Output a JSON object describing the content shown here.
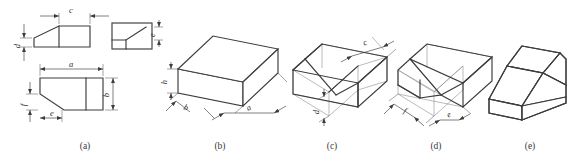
{
  "figure": {
    "line_color": "#3c3c3c",
    "thin_line_color": "#6e6e6e",
    "label_color": "#3a3a3a",
    "background": "#ffffff"
  },
  "captions": [
    {
      "key": "a",
      "label": "(a)"
    },
    {
      "key": "b",
      "label": "(b)"
    },
    {
      "key": "c",
      "label": "(c)"
    },
    {
      "key": "d",
      "label": "(d)"
    },
    {
      "key": "e",
      "label": "(e)"
    }
  ],
  "dimension_symbols": {
    "a": "a",
    "b": "b",
    "c": "c",
    "d": "d",
    "e": "e",
    "f": "f",
    "h": "h"
  },
  "panels": {
    "a": {
      "name": "orthographic-views",
      "views": [
        {
          "name": "front-view",
          "dimensions": [
            {
              "symbol": "c",
              "placement": "top",
              "orientation": "horizontal"
            },
            {
              "symbol": "d",
              "placement": "left",
              "orientation": "vertical"
            }
          ]
        },
        {
          "name": "side-view",
          "dimensions": [
            {
              "symbol": "e",
              "placement": "right",
              "orientation": "vertical"
            }
          ]
        },
        {
          "name": "top-view",
          "dimensions": [
            {
              "symbol": "a",
              "placement": "top",
              "orientation": "horizontal"
            },
            {
              "symbol": "b",
              "placement": "right",
              "orientation": "vertical"
            },
            {
              "symbol": "f",
              "placement": "left",
              "orientation": "vertical"
            },
            {
              "symbol": "e",
              "placement": "bottom",
              "orientation": "horizontal"
            }
          ]
        }
      ]
    },
    "b": {
      "name": "base-block",
      "description": "Rectangular prism blank",
      "dimensions": [
        {
          "symbol": "h",
          "placement": "left-edge",
          "orientation": "vertical"
        },
        {
          "symbol": "b",
          "placement": "front-left-edge",
          "orientation": "oblique"
        },
        {
          "symbol": "a",
          "placement": "front-right-edge",
          "orientation": "oblique"
        }
      ]
    },
    "c": {
      "name": "first-cut-block",
      "description": "Block with inclined wedge cut, construction lines shown",
      "dimensions": [
        {
          "symbol": "c",
          "placement": "top",
          "orientation": "oblique"
        },
        {
          "symbol": "d",
          "placement": "front-bottom",
          "orientation": "vertical"
        }
      ]
    },
    "d": {
      "name": "second-cut-block",
      "description": "Block with second corner cut, construction lines shown",
      "dimensions": [
        {
          "symbol": "f",
          "placement": "bottom-left",
          "orientation": "oblique"
        },
        {
          "symbol": "e",
          "placement": "bottom-right",
          "orientation": "oblique"
        }
      ]
    },
    "e": {
      "name": "final-solid",
      "description": "Completed solid after both cuts"
    }
  }
}
